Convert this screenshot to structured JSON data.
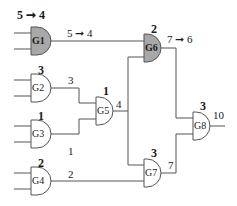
{
  "colors": {
    "line": "#555555",
    "shaded_gate": "#a8a8a8",
    "plain_gate": "#ffffff",
    "text": "#1a1a1a"
  },
  "gates": [
    {
      "id": "G1",
      "name": "G1",
      "shaded": true,
      "top_label": "5 ➞ 4",
      "wire_label": "5 ➞ 4"
    },
    {
      "id": "G2",
      "name": "G2",
      "shaded": false,
      "top_label": "3",
      "wire_label": "3"
    },
    {
      "id": "G3",
      "name": "G3",
      "shaded": false,
      "top_label": "1",
      "wire_label": "1"
    },
    {
      "id": "G4",
      "name": "G4",
      "shaded": false,
      "top_label": "2",
      "wire_label": "2"
    },
    {
      "id": "G5",
      "name": "G5",
      "shaded": false,
      "top_label": "1",
      "wire_label": "4"
    },
    {
      "id": "G6",
      "name": "G6",
      "shaded": true,
      "top_label": "2",
      "wire_label": "7 ➞ 6"
    },
    {
      "id": "G7",
      "name": "G7",
      "shaded": false,
      "top_label": "3",
      "wire_label": "7"
    },
    {
      "id": "G8",
      "name": "G8",
      "shaded": false,
      "top_label": "3",
      "wire_label": "10"
    }
  ]
}
